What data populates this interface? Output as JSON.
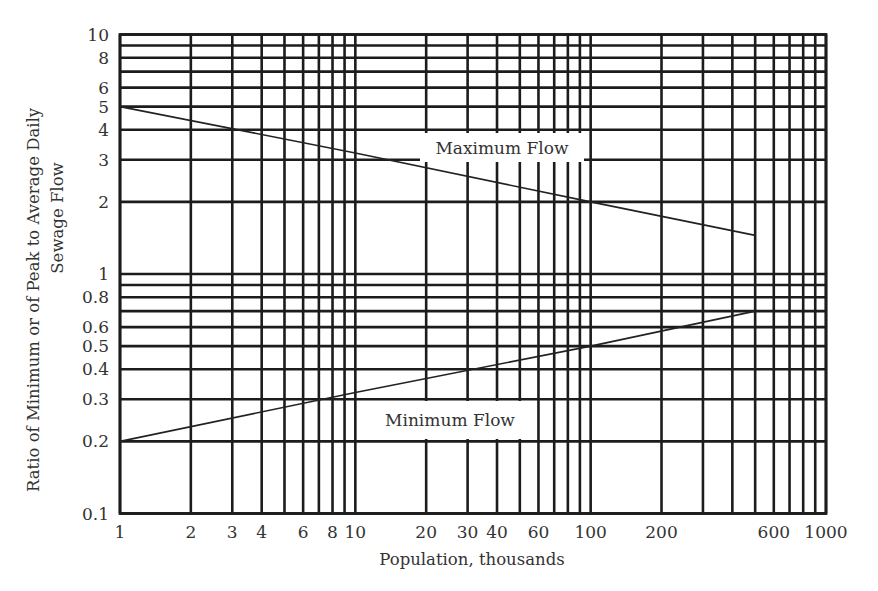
{
  "chart_data": {
    "type": "line",
    "title": "",
    "xlabel": "Population, thousands",
    "ylabel": "Ratio of Minimum or of Peak to Average Daily Sewage Flow",
    "ylabel_lines": [
      "Ratio of Minimum or of Peak to Average Daily",
      "Sewage Flow"
    ],
    "xscale": "log",
    "yscale": "log",
    "xlim": [
      1,
      1000
    ],
    "ylim": [
      0.1,
      10
    ],
    "grid": true,
    "legend": "none (inline curve labels)",
    "x_ticks": [
      1,
      2,
      3,
      4,
      6,
      8,
      10,
      20,
      30,
      40,
      60,
      100,
      200,
      600,
      1000
    ],
    "x_tick_labels": [
      "1",
      "2",
      "3",
      "4",
      "6",
      "8",
      "10",
      "20",
      "30",
      "40",
      "60",
      "100",
      "200",
      "600",
      "1000"
    ],
    "x_gridlines": [
      1,
      2,
      3,
      4,
      5,
      6,
      7,
      8,
      9,
      10,
      20,
      30,
      40,
      50,
      60,
      70,
      80,
      90,
      100,
      200,
      300,
      400,
      500,
      600,
      700,
      800,
      900,
      1000
    ],
    "y_ticks": [
      0.1,
      0.2,
      0.3,
      0.4,
      0.5,
      0.6,
      0.8,
      1,
      2,
      3,
      4,
      5,
      6,
      8,
      10
    ],
    "y_tick_labels": [
      "0.1",
      "0.2",
      "0.3",
      "0.4",
      "0.5",
      "0.6",
      "0.8",
      "1",
      "2",
      "3",
      "4",
      "5",
      "6",
      "8",
      "10"
    ],
    "y_gridlines": [
      0.1,
      0.2,
      0.3,
      0.4,
      0.5,
      0.6,
      0.7,
      0.8,
      0.9,
      1,
      2,
      3,
      4,
      5,
      6,
      7,
      8,
      9,
      10
    ],
    "series": [
      {
        "name": "Maximum Flow",
        "x": [
          1,
          10,
          100,
          500
        ],
        "values": [
          5.0,
          3.2,
          2.0,
          1.45
        ],
        "label_position": {
          "x": 40,
          "y": 3.5
        }
      },
      {
        "name": "Minimum Flow",
        "x": [
          1,
          10,
          100,
          500
        ],
        "values": [
          0.2,
          0.32,
          0.5,
          0.7
        ],
        "label_position": {
          "x": 30,
          "y": 0.245
        }
      }
    ],
    "annotations": [
      "Maximum Flow",
      "Minimum Flow"
    ]
  },
  "labels": {
    "xlabel": "Population, thousands",
    "ylabel_line1": "Ratio of Minimum or of Peak to Average Daily",
    "ylabel_line2": "Sewage Flow",
    "max_flow": "Maximum Flow",
    "min_flow": "Minimum Flow"
  },
  "colors": {
    "grid": "#1c1c1c",
    "curve": "#222222",
    "text": "#333333",
    "background": "#ffffff"
  }
}
